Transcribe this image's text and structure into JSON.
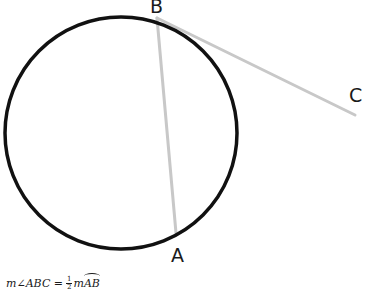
{
  "diagram": {
    "circle": {
      "cx": 121,
      "cy": 133,
      "r": 116,
      "stroke": "#111111",
      "stroke_width": 3.5
    },
    "points": {
      "A": {
        "label": "A",
        "x": 176,
        "y": 233,
        "label_x": 171,
        "label_y": 262
      },
      "B": {
        "label": "B",
        "x": 157,
        "y": 18,
        "label_x": 150,
        "label_y": 13
      },
      "C": {
        "label": "C",
        "x": 355,
        "y": 115,
        "label_x": 349,
        "label_y": 102
      }
    },
    "segments": [
      {
        "name": "chord-BA",
        "from": "B",
        "to": "A",
        "stroke": "#c8c8c8",
        "stroke_width": 3
      },
      {
        "name": "tangent-BC",
        "from": "B",
        "to": "C",
        "stroke": "#c8c8c8",
        "stroke_width": 3
      }
    ],
    "formula": {
      "lhs": "m∠ABC =",
      "frac_num": "1",
      "frac_den": "2",
      "rhs_prefix": "m",
      "arc": "AB"
    }
  }
}
